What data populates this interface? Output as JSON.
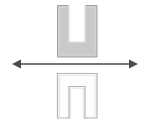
{
  "figure": {
    "canvas": {
      "width": 147,
      "height": 120,
      "background": "#ffffff"
    },
    "colors": {
      "upper_shape_fill": "#c9c9c9",
      "upper_shape_stroke": "#a0a0a0",
      "upper_shape_inner_stroke": "#d8d8d8",
      "lower_shape_fill": "#fdfdfd",
      "lower_shape_stroke": "#b4b4b4",
      "lower_shape_inner_stroke": "#e2e2e2",
      "notch_fill": "#ffffff",
      "arrow_color": "#4a4a4a"
    },
    "shapes": [
      {
        "name": "upper-u-shape",
        "orientation": "U",
        "description": "Filled gray U-shaped block, opening upward",
        "outer": {
          "x": 57,
          "y": 5,
          "width": 40,
          "height": 52
        },
        "notch": {
          "x": 69,
          "y": 5,
          "width": 16,
          "height": 37
        },
        "arm_width": 12,
        "base_height": 15
      },
      {
        "name": "lower-n-shape",
        "orientation": "N",
        "description": "Outlined white inverted-U block, opening downward (mirror image)",
        "outer": {
          "x": 57,
          "y": 73,
          "width": 40,
          "height": 45
        },
        "notch": {
          "x": 69,
          "y": 86,
          "width": 16,
          "height": 32
        },
        "arm_width": 12,
        "base_height": 13
      }
    ],
    "arrow": {
      "name": "mirror-axis-arrow",
      "type": "double-headed-horizontal",
      "y": 64,
      "x_start": 12,
      "x_end": 138,
      "line_thickness": 1.4,
      "head_length": 9,
      "head_half_width": 4.5,
      "label": ""
    }
  }
}
